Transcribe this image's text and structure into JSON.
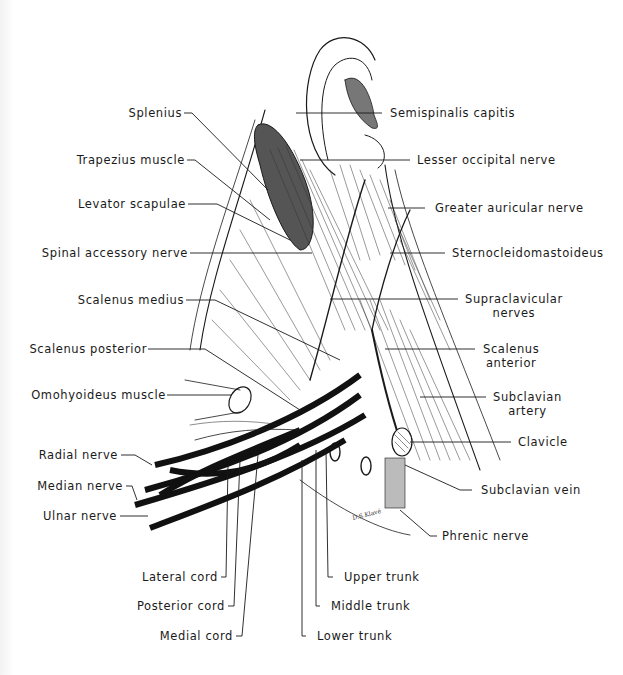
{
  "figure": {
    "signature": "D.S.Klavé"
  },
  "labels_left": [
    {
      "id": "splenius",
      "text": "Splenius"
    },
    {
      "id": "trapezius",
      "text": "Trapezius muscle"
    },
    {
      "id": "levator",
      "text": "Levator scapulae"
    },
    {
      "id": "spinal-accessory",
      "text": "Spinal accessory nerve"
    },
    {
      "id": "scalenus-medius",
      "text": "Scalenus medius"
    },
    {
      "id": "scalenus-posterior",
      "text": "Scalenus posterior"
    },
    {
      "id": "omohyoideus",
      "text": "Omohyoideus muscle"
    },
    {
      "id": "radial",
      "text": "Radial nerve"
    },
    {
      "id": "median",
      "text": "Median nerve"
    },
    {
      "id": "ulnar",
      "text": "Ulnar nerve"
    }
  ],
  "labels_right": [
    {
      "id": "semispinalis",
      "text": "Semispinalis capitis"
    },
    {
      "id": "lesser-occipital",
      "text": "Lesser occipital nerve"
    },
    {
      "id": "greater-auricular",
      "text": "Greater auricular nerve"
    },
    {
      "id": "sternocleido",
      "text": "Sternocleidomastoideus"
    },
    {
      "id": "supraclavicular",
      "text": "Supraclavicular",
      "text2": "nerves"
    },
    {
      "id": "scalenus-anterior",
      "text": "Scalenus",
      "text2": "anterior"
    },
    {
      "id": "subclavian-artery",
      "text": "Subclavian",
      "text2": "artery"
    },
    {
      "id": "clavicle",
      "text": "Clavicle"
    },
    {
      "id": "subclavian-vein",
      "text": "Subclavian vein"
    },
    {
      "id": "phrenic",
      "text": "Phrenic nerve"
    }
  ],
  "labels_bottom": [
    {
      "id": "lateral-cord",
      "text": "Lateral cord"
    },
    {
      "id": "posterior-cord",
      "text": "Posterior cord"
    },
    {
      "id": "medial-cord",
      "text": "Medial cord"
    },
    {
      "id": "upper-trunk",
      "text": "Upper trunk"
    },
    {
      "id": "middle-trunk",
      "text": "Middle trunk"
    },
    {
      "id": "lower-trunk",
      "text": "Lower trunk"
    }
  ],
  "colors": {
    "ink": "#1a1a1a",
    "paper": "#ffffff",
    "shade": "#888888"
  }
}
